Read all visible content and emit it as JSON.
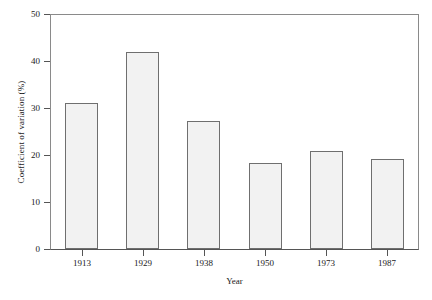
{
  "chart_data": {
    "type": "bar",
    "title": "",
    "subtitle": "",
    "xlabel": "Year",
    "ylabel": "Coefficient of variation (%)",
    "categories": [
      "1913",
      "1929",
      "1938",
      "1950",
      "1973",
      "1987"
    ],
    "values": [
      31.0,
      42.0,
      27.3,
      18.4,
      20.8,
      19.1
    ],
    "series": [
      {
        "name": "Coefficient of variation",
        "values": [
          31.0,
          42.0,
          27.3,
          18.4,
          20.8,
          19.1
        ]
      }
    ],
    "ylim": [
      0,
      50
    ],
    "ytick_labels": [
      "0",
      "10",
      "20",
      "30",
      "40",
      "50"
    ],
    "ytick_values": [
      0,
      10,
      20,
      30,
      40,
      50
    ],
    "xtick_labels": [
      "1913",
      "1929",
      "1938",
      "1950",
      "1973",
      "1987"
    ],
    "grid": false,
    "legend": false,
    "legend_position": "none",
    "annotations": [],
    "colors": {
      "bar_fill": "#f2f2f2",
      "bar_edge": "#6f6f6f",
      "axis": "#555555",
      "frame": "#8a8a8a",
      "text": "#1a1a1a",
      "background": "#ffffff"
    }
  }
}
